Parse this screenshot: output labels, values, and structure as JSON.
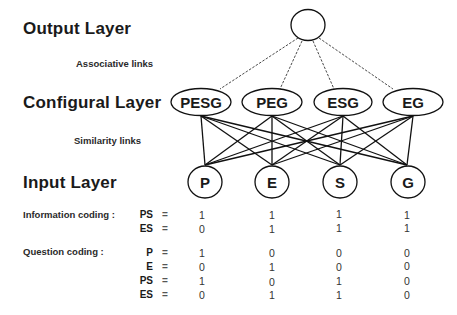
{
  "labels": {
    "output_layer": "Output Layer",
    "associative_links": "Associative links",
    "configural_layer": "Configural Layer",
    "similarity_links": "Similarity links",
    "input_layer": "Input Layer"
  },
  "output_node": {
    "label": ""
  },
  "configural_nodes": [
    {
      "label": "PESG"
    },
    {
      "label": "PEG"
    },
    {
      "label": "ESG"
    },
    {
      "label": "EG"
    }
  ],
  "input_nodes": [
    {
      "label": "P"
    },
    {
      "label": "E"
    },
    {
      "label": "S"
    },
    {
      "label": "G"
    }
  ],
  "information_coding": {
    "title": "Information coding :",
    "rows": [
      {
        "key": "PS",
        "eq": "=",
        "values": [
          "1",
          "1",
          "1",
          "1"
        ]
      },
      {
        "key": "ES",
        "eq": "=",
        "values": [
          "0",
          "1",
          "1",
          "1"
        ]
      }
    ]
  },
  "question_coding": {
    "title": "Question coding :",
    "rows": [
      {
        "key": "P",
        "eq": "=",
        "values": [
          "1",
          "0",
          "0",
          "0"
        ]
      },
      {
        "key": "E",
        "eq": "=",
        "values": [
          "0",
          "1",
          "0",
          "0"
        ]
      },
      {
        "key": "PS",
        "eq": "=",
        "values": [
          "1",
          "0",
          "1",
          "0"
        ]
      },
      {
        "key": "ES",
        "eq": "=",
        "values": [
          "0",
          "1",
          "1",
          "0"
        ]
      }
    ]
  }
}
